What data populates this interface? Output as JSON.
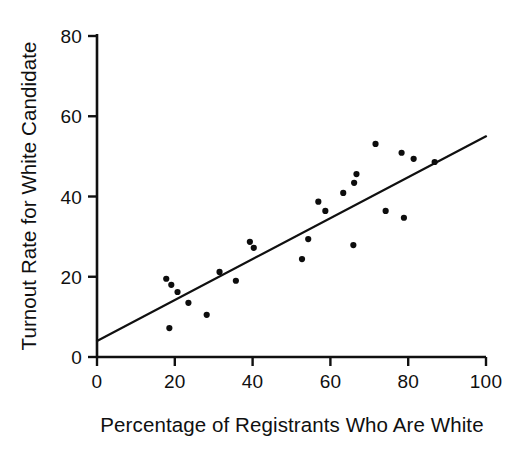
{
  "chart_data": {
    "type": "scatter",
    "title": "",
    "xlabel": "Percentage of Registrants Who Are White",
    "ylabel": "Turnout Rate for White Candidate",
    "xlim": [
      0,
      100
    ],
    "ylim": [
      0,
      80
    ],
    "xticks": [
      0,
      20,
      40,
      60,
      80,
      100
    ],
    "yticks": [
      0,
      20,
      40,
      60,
      80
    ],
    "xtick_labels": [
      "0",
      "20",
      "40",
      "60",
      "80",
      "100"
    ],
    "ytick_labels": [
      "0",
      "20",
      "40",
      "60",
      "80"
    ],
    "grid": false,
    "legend": false,
    "point_color": "#0d0d0d",
    "line_color": "#101010",
    "axis_color": "#101010",
    "background": "#ffffff",
    "series": [
      {
        "name": "precincts",
        "marker": "filled-circle",
        "points": [
          [
            17.8,
            19.5
          ],
          [
            19.1,
            18.0
          ],
          [
            20.7,
            16.2
          ],
          [
            23.5,
            13.5
          ],
          [
            18.6,
            7.2
          ],
          [
            28.2,
            10.5
          ],
          [
            31.5,
            21.2
          ],
          [
            35.7,
            19.0
          ],
          [
            39.3,
            28.7
          ],
          [
            40.3,
            27.2
          ],
          [
            52.7,
            24.4
          ],
          [
            54.3,
            29.4
          ],
          [
            56.9,
            38.7
          ],
          [
            58.7,
            36.4
          ],
          [
            63.3,
            40.9
          ],
          [
            65.9,
            27.9
          ],
          [
            66.1,
            43.4
          ],
          [
            66.7,
            45.6
          ],
          [
            71.6,
            53.1
          ],
          [
            74.2,
            36.4
          ],
          [
            78.3,
            50.9
          ],
          [
            78.9,
            34.7
          ],
          [
            81.4,
            49.4
          ],
          [
            86.8,
            48.6
          ]
        ]
      }
    ],
    "fit_line": {
      "name": "regression-line",
      "x0": 0,
      "y0": 4.0,
      "x1": 100,
      "y1": 55.0
    }
  }
}
